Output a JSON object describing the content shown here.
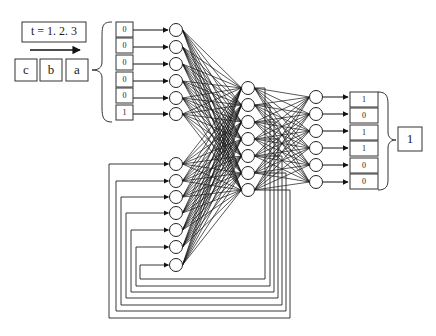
{
  "title_box": {
    "text": "t = 1. 2. 3"
  },
  "sequence": [
    "c",
    "b",
    "a"
  ],
  "input_values": [
    "0",
    "0",
    "0",
    "0",
    "0",
    "1"
  ],
  "output_values": [
    "1",
    "0",
    "1",
    "1",
    "0",
    "0"
  ],
  "result": "1",
  "layers": {
    "input_nodes": 6,
    "context_nodes": 7,
    "hidden_nodes": 7,
    "output_nodes": 6
  },
  "colors": {
    "line": "#111111",
    "box_border": "#333333",
    "background": "#ffffff"
  }
}
